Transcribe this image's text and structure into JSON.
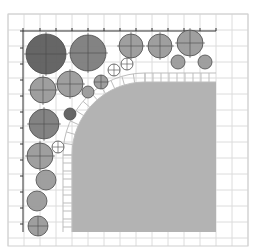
{
  "diagram": {
    "type": "planting-plan",
    "canvas": {
      "width": 253,
      "height": 250
    },
    "colors": {
      "background": "#ffffff",
      "grid": "#dcdcdc",
      "frame": "#cfcfcf",
      "axis": "#333333",
      "lawn": "#b3b3b3",
      "paver_stroke": "#bdbdbd",
      "tree_dark": "#5e5e5e",
      "tree_mid": "#7c7c7c",
      "shrub": "#9a9a9a",
      "shrub_light": "#a9a9a9",
      "small_open": "#ffffff",
      "outline": "#4a4a4a"
    },
    "grid": {
      "x0": 8,
      "y0": 14,
      "x1": 248,
      "y1": 246,
      "step": 16
    },
    "axis": {
      "top": {
        "y": 31,
        "x_start": 23,
        "x_end": 216,
        "ticks": [
          23,
          40,
          56,
          72,
          88,
          104,
          120,
          136,
          152,
          168,
          184,
          200,
          216
        ]
      },
      "left": {
        "x": 23,
        "y_start": 31,
        "y_end": 232,
        "ticks": [
          31,
          48,
          64,
          80,
          96,
          112,
          128,
          144,
          160,
          176,
          192,
          208,
          224
        ]
      }
    },
    "lawn": {
      "x_left": 72,
      "y_top": 82,
      "x_right": 216,
      "y_bottom": 232,
      "corner_cx": 145,
      "corner_cy": 155,
      "corner_r": 73
    },
    "paver_band": {
      "width": 9,
      "count": 24
    },
    "plants": [
      {
        "cx": 46,
        "cy": 54,
        "r": 20,
        "tone": "tree_dark",
        "cross": true
      },
      {
        "cx": 88,
        "cy": 53,
        "r": 18,
        "tone": "tree_mid",
        "cross": true
      },
      {
        "cx": 131,
        "cy": 46,
        "r": 12,
        "tone": "shrub",
        "cross": true
      },
      {
        "cx": 160,
        "cy": 46,
        "r": 12,
        "tone": "shrub",
        "cross": true
      },
      {
        "cx": 190,
        "cy": 43,
        "r": 13,
        "tone": "shrub",
        "cross": true
      },
      {
        "cx": 178,
        "cy": 62,
        "r": 7,
        "tone": "shrub",
        "cross": false
      },
      {
        "cx": 205,
        "cy": 62,
        "r": 7,
        "tone": "shrub",
        "cross": false
      },
      {
        "cx": 43,
        "cy": 90,
        "r": 13,
        "tone": "shrub",
        "cross": true
      },
      {
        "cx": 70,
        "cy": 84,
        "r": 13,
        "tone": "shrub",
        "cross": true
      },
      {
        "cx": 88,
        "cy": 92,
        "r": 6,
        "tone": "shrub",
        "cross": false
      },
      {
        "cx": 101,
        "cy": 82,
        "r": 7,
        "tone": "shrub",
        "cross": true
      },
      {
        "cx": 114,
        "cy": 70,
        "r": 6,
        "tone": "small_open",
        "cross": true
      },
      {
        "cx": 127,
        "cy": 64,
        "r": 6,
        "tone": "small_open",
        "cross": true
      },
      {
        "cx": 44,
        "cy": 124,
        "r": 15,
        "tone": "tree_mid",
        "cross": true
      },
      {
        "cx": 70,
        "cy": 114,
        "r": 6,
        "tone": "tree_dark",
        "cross": false
      },
      {
        "cx": 58,
        "cy": 147,
        "r": 6,
        "tone": "small_open",
        "cross": true
      },
      {
        "cx": 40,
        "cy": 156,
        "r": 13,
        "tone": "shrub",
        "cross": true
      },
      {
        "cx": 46,
        "cy": 180,
        "r": 10,
        "tone": "shrub",
        "cross": false
      },
      {
        "cx": 37,
        "cy": 201,
        "r": 10,
        "tone": "shrub",
        "cross": false
      },
      {
        "cx": 38,
        "cy": 226,
        "r": 10,
        "tone": "shrub",
        "cross": true
      }
    ]
  }
}
